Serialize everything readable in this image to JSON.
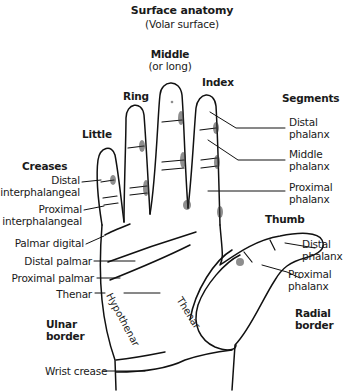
{
  "title": {
    "main": "Surface anatomy",
    "sub": "(Volar surface)"
  },
  "fingers": {
    "middle": "Middle",
    "middle_sub": "(or long)",
    "index": "Index",
    "ring": "Ring",
    "little": "Little",
    "thumb": "Thumb"
  },
  "segments": {
    "heading": "Segments",
    "distal_line1": "Distal",
    "distal_line2": "phalanx",
    "middle_line1": "Middle",
    "middle_line2": "phalanx",
    "proximal_line1": "Proximal",
    "proximal_line2": "phalanx"
  },
  "thumb_segments": {
    "distal_line1": "Distal",
    "distal_line2": "phalanx",
    "proximal_line1": "Proximal",
    "proximal_line2": "phalanx"
  },
  "creases": {
    "heading": "Creases",
    "distal_ip_line1": "Distal",
    "distal_ip_line2": "interphalangeal",
    "proximal_ip_line1": "Proximal",
    "proximal_ip_line2": "interphalangeal",
    "palmar_digital": "Palmar digital",
    "distal_palmar": "Distal palmar",
    "proximal_palmar": "Proximal palmar",
    "thenar": "Thenar",
    "wrist": "Wrist crease"
  },
  "regions": {
    "hypothenar": "Hypothenar",
    "thenar": "Thenar"
  },
  "borders": {
    "ulnar_line1": "Ulnar",
    "ulnar_line2": "border",
    "radial_line1": "Radial",
    "radial_line2": "border"
  }
}
